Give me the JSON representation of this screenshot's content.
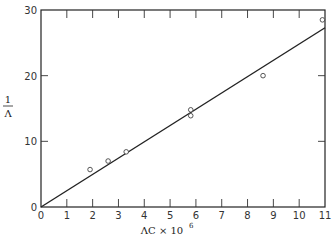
{
  "chart_data": {
    "type": "scatter",
    "title": "",
    "xlabel": "ΛC × 10⁶",
    "ylabel": "1/Λ",
    "xlim": [
      0,
      11
    ],
    "ylim": [
      0,
      30
    ],
    "xticks": [
      0,
      1,
      2,
      3,
      4,
      5,
      6,
      7,
      8,
      9,
      10,
      11
    ],
    "yticks": [
      0,
      10,
      20,
      30
    ],
    "grid": false,
    "legend": null,
    "series": [
      {
        "name": "measured",
        "type": "scatter",
        "marker": "open-circle",
        "x": [
          1.9,
          2.6,
          3.3,
          5.8,
          5.8,
          8.6,
          10.9
        ],
        "y": [
          5.7,
          7.0,
          8.4,
          14.8,
          13.9,
          20.0,
          28.5
        ]
      },
      {
        "name": "fit",
        "type": "line",
        "x": [
          0,
          11
        ],
        "y": [
          0,
          27.3
        ]
      }
    ]
  },
  "labels": {
    "ylabel_num": "1",
    "ylabel_den": "Λ",
    "xlabel_main": "ΛC × 10",
    "xlabel_exp": "6"
  }
}
